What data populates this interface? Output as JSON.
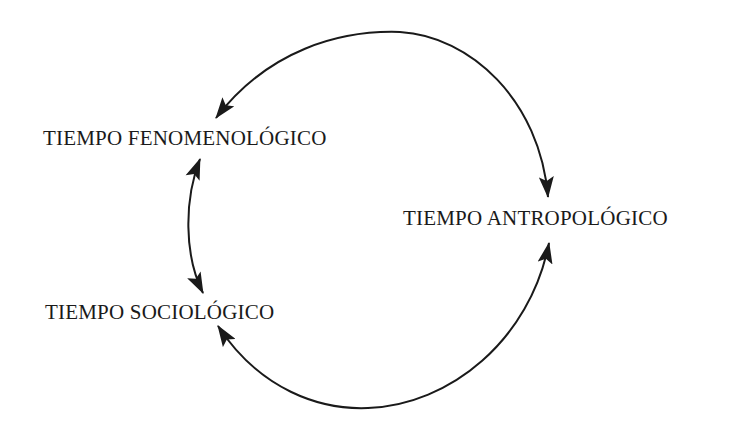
{
  "diagram": {
    "type": "cycle",
    "nodes": [
      {
        "id": "fenomenologico",
        "label": "TIEMPO FENOMENOLÓGICO"
      },
      {
        "id": "antropologico",
        "label": "TIEMPO ANTROPOLÓGICO"
      },
      {
        "id": "sociologico",
        "label": "TIEMPO SOCIOLÓGICO"
      }
    ],
    "edges": [
      {
        "from": "antropologico",
        "to": "fenomenologico",
        "style": "curved-arrow",
        "direction": "bidirectional-top-arc"
      },
      {
        "from": "fenomenologico",
        "to": "sociologico",
        "style": "double-arrow"
      },
      {
        "from": "sociologico",
        "to": "antropologico",
        "style": "curved-arrow",
        "direction": "bidirectional-bottom-arc"
      }
    ],
    "colors": {
      "background": "#ffffff",
      "ink": "#1a1a1a"
    }
  }
}
